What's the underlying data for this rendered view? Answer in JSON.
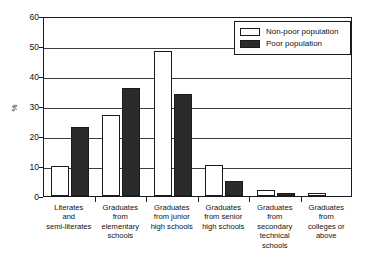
{
  "chart_data": {
    "type": "bar",
    "title": "",
    "xlabel": "",
    "ylabel": "%",
    "ylim": [
      0,
      60
    ],
    "yticks": [
      0,
      10,
      20,
      30,
      40,
      50,
      60
    ],
    "grid": true,
    "legend_position": "top-right",
    "categories": [
      "Literates and semi-literates",
      "Graduates from elementary schools",
      "Graduates from junior high schools",
      "Graduates from senior high schools",
      "Graduates from secondary technical schools",
      "Graduates from colleges or above"
    ],
    "category_lines": [
      [
        "Literates",
        "and",
        "semi-literates"
      ],
      [
        "Graduates",
        "from",
        "elementary",
        "schools"
      ],
      [
        "Graduates",
        "from junior",
        "high schools"
      ],
      [
        "Graduates",
        "from senior",
        "high schools"
      ],
      [
        "Graduates",
        "from",
        "secondary",
        "technical",
        "schools"
      ],
      [
        "Graduates",
        "from",
        "colleges or",
        "above"
      ]
    ],
    "series": [
      {
        "name": "Non-poor population",
        "color": "#ffffff",
        "values": [
          10,
          27,
          48.5,
          10.5,
          2,
          1
        ]
      },
      {
        "name": "Poor population",
        "color": "#2b2b2b",
        "values": [
          23,
          36,
          34,
          5,
          1,
          0
        ]
      }
    ]
  },
  "legend": {
    "items": [
      {
        "label": "Non-poor population",
        "swatch": "nonpoor"
      },
      {
        "label": "Poor population",
        "swatch": "poor"
      }
    ]
  },
  "axis": {
    "y_title": "%",
    "y_tick_labels": [
      "60",
      "50",
      "40",
      "30",
      "20",
      "10",
      "0"
    ]
  },
  "colors": {
    "bar_nonpoor": "#ffffff",
    "bar_poor": "#2b2b2b",
    "axis": "#1a1a1a",
    "gridline": "#3d3d3d",
    "background": "#ffffff"
  }
}
